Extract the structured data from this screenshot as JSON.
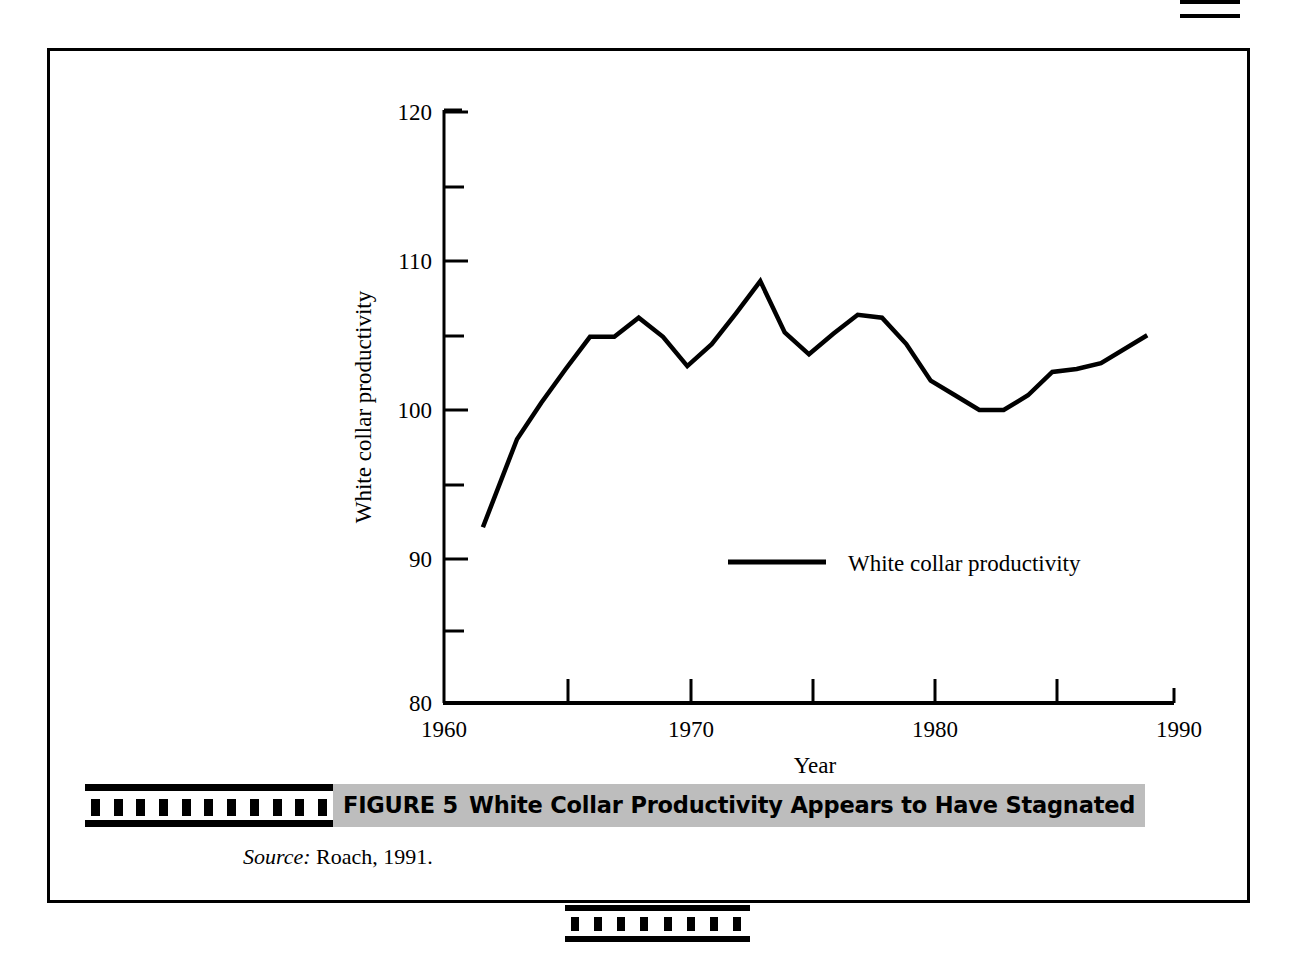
{
  "figure": {
    "number_label": "FIGURE 5",
    "caption": "White Collar Productivity Appears to Have Stagnated",
    "source_label": "Source:",
    "source_text": "Roach, 1991."
  },
  "chart_data": {
    "type": "line",
    "title": "",
    "xlabel": "Year",
    "ylabel": "White collar productivity",
    "xlim": [
      1960,
      1990
    ],
    "ylim": [
      80,
      120
    ],
    "x_major_ticks": [
      1960,
      1970,
      1980,
      1990
    ],
    "x_major_tick_labels": [
      "1960",
      "1970",
      "1980",
      "1990"
    ],
    "x_minor_ticks": [
      1965,
      1975,
      1985
    ],
    "y_major_ticks": [
      80,
      90,
      100,
      110,
      120
    ],
    "y_major_tick_labels": [
      "80",
      "90",
      "100",
      "110",
      "120"
    ],
    "y_minor_ticks": [
      85,
      95,
      105,
      115
    ],
    "grid": false,
    "legend_position": "inside-center",
    "line_color": "#000000",
    "series": [
      {
        "name": "White collar productivity",
        "x": [
          1961.6,
          1963,
          1964,
          1965,
          1966,
          1967,
          1968,
          1969,
          1970,
          1971,
          1972,
          1973,
          1974,
          1975,
          1976,
          1977,
          1978,
          1979,
          1980,
          1981,
          1982,
          1983,
          1984,
          1985,
          1986,
          1987,
          1988.9
        ],
        "values": [
          92.0,
          98.0,
          100.5,
          102.8,
          105.0,
          105.0,
          106.3,
          105.0,
          103.0,
          104.5,
          106.6,
          108.8,
          105.3,
          103.8,
          105.2,
          106.5,
          106.3,
          104.5,
          102.0,
          101.0,
          100.0,
          100.0,
          101.0,
          102.6,
          102.8,
          103.2,
          105.1
        ]
      }
    ]
  },
  "axis": {
    "y_title": "White collar productivity",
    "x_title": "Year"
  },
  "legend": {
    "entries": [
      {
        "label": "White collar productivity",
        "swatch": "line-swatch"
      }
    ]
  }
}
